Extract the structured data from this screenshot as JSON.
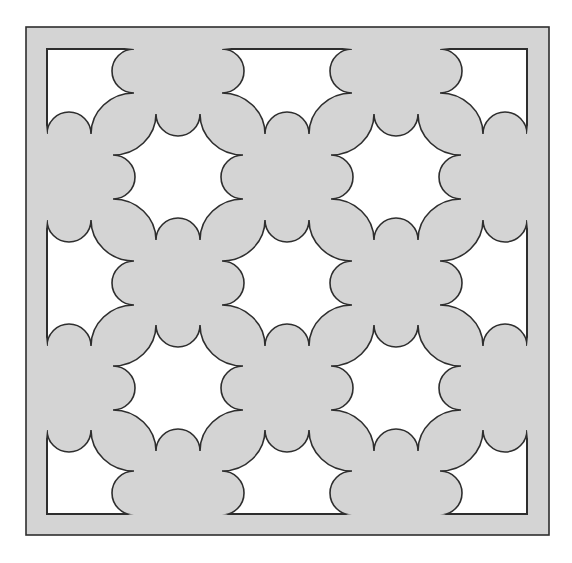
{
  "figure": {
    "title": "",
    "canvas": {
      "width": 572,
      "height": 563,
      "background": "#ffffff"
    },
    "colors": {
      "panel_fill": "#d4d4d4",
      "hole_fill": "#ffffff",
      "stroke": "#2e2e2e"
    },
    "stroke_width": 1.6,
    "outer_frame": {
      "x1": 26,
      "y1": 27,
      "x2": 549,
      "y2": 535
    },
    "inner_frame": {
      "x1": 47,
      "y1": 49,
      "x2": 527,
      "y2": 514
    },
    "lattice": {
      "columns_x": [
        69,
        178,
        287,
        396,
        505
      ],
      "rows_y": [
        71,
        177,
        283,
        388,
        493
      ],
      "rule": "star where (col + row) is even"
    },
    "star": {
      "tip_half_gap": 22,
      "tip_extent_x": 65,
      "tip_extent_y": 63,
      "notch_radius": 22,
      "corner_radius": 43
    },
    "stars": [
      {
        "col": 0,
        "row": 0,
        "kind": "corner-quarter"
      },
      {
        "col": 2,
        "row": 0,
        "kind": "edge-half"
      },
      {
        "col": 4,
        "row": 0,
        "kind": "corner-quarter"
      },
      {
        "col": 1,
        "row": 1,
        "kind": "full"
      },
      {
        "col": 3,
        "row": 1,
        "kind": "full"
      },
      {
        "col": 0,
        "row": 2,
        "kind": "edge-half"
      },
      {
        "col": 2,
        "row": 2,
        "kind": "full"
      },
      {
        "col": 4,
        "row": 2,
        "kind": "edge-half"
      },
      {
        "col": 1,
        "row": 3,
        "kind": "full"
      },
      {
        "col": 3,
        "row": 3,
        "kind": "full"
      },
      {
        "col": 0,
        "row": 4,
        "kind": "corner-quarter"
      },
      {
        "col": 2,
        "row": 4,
        "kind": "edge-half"
      },
      {
        "col": 4,
        "row": 4,
        "kind": "corner-quarter"
      }
    ]
  }
}
